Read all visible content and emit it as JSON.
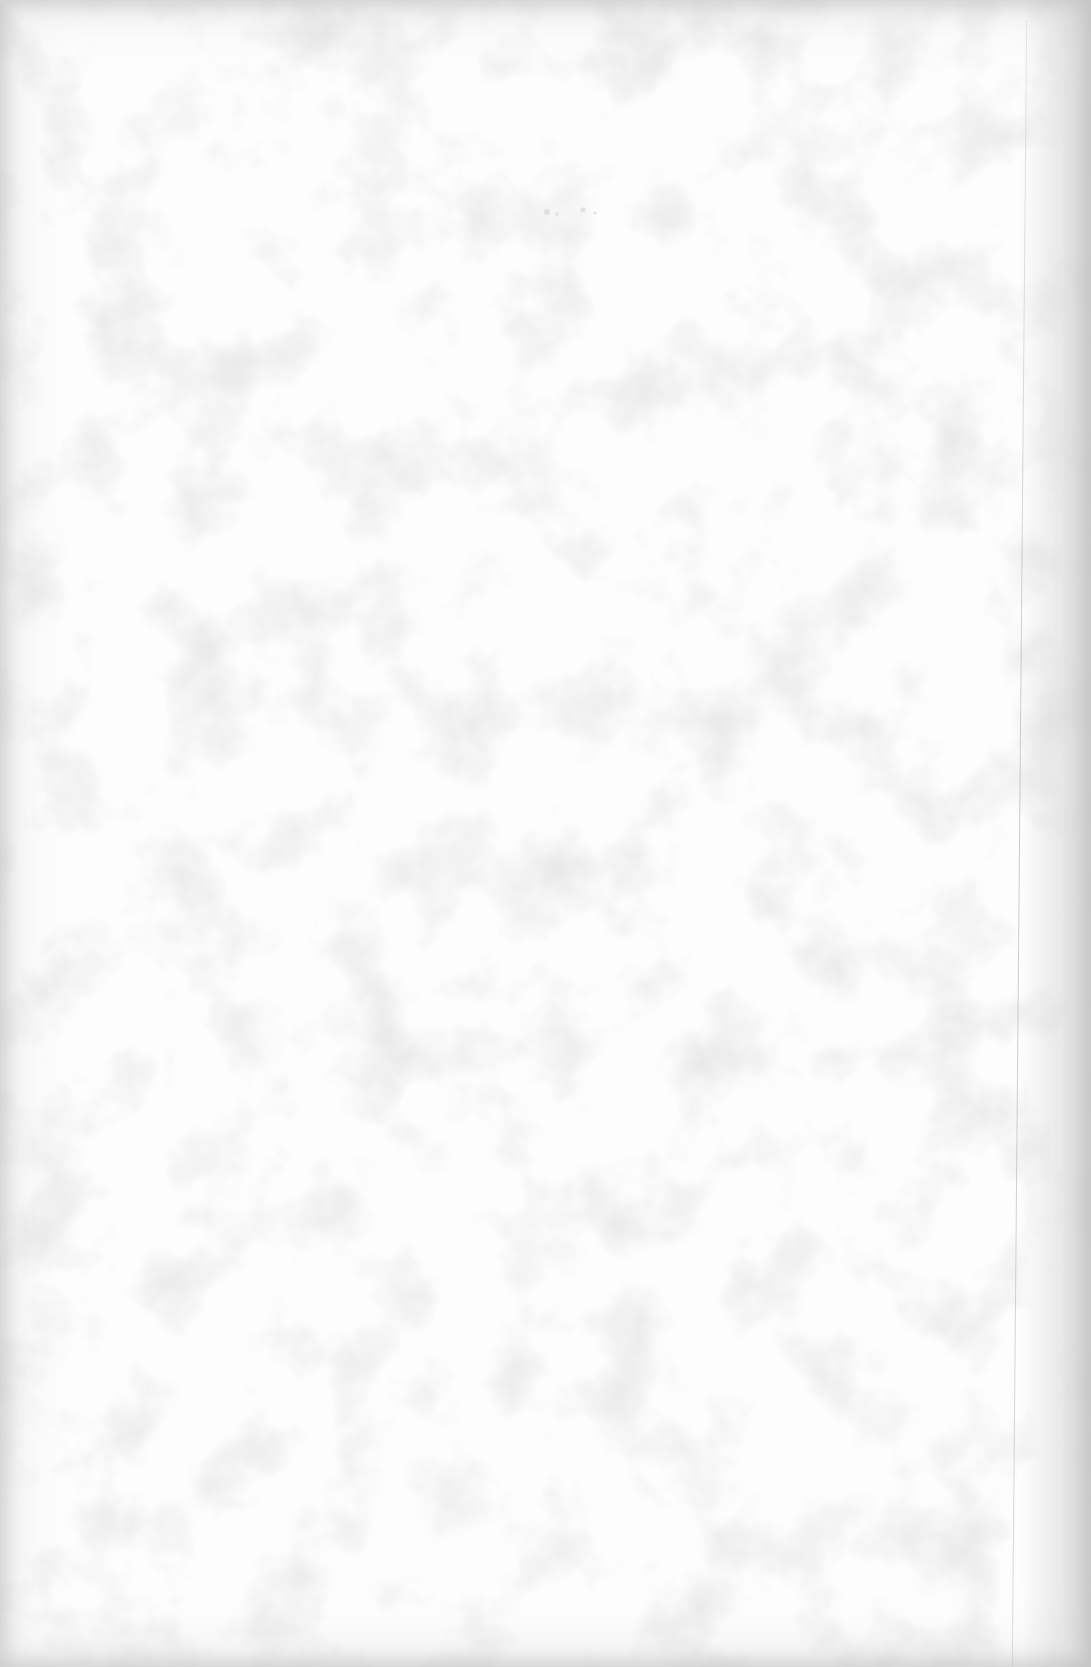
{
  "document": {
    "type": "blank-scanned-page",
    "text_content": "",
    "colors": {
      "paper": "#fdfdfd",
      "edge_shadow": "#c8c8c8",
      "grain": "#d9d9d9",
      "fold_line": "#a8a8a8"
    }
  }
}
